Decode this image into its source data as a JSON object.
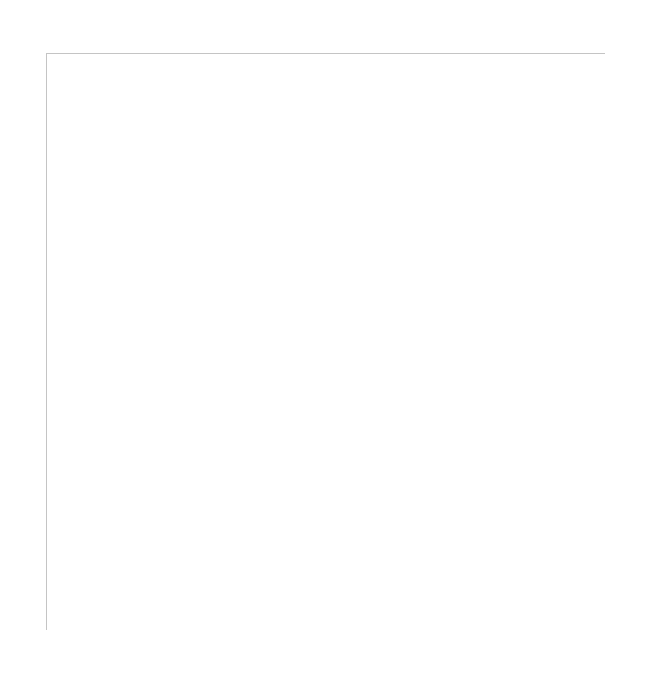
{
  "grid": {
    "columns": [
      "A",
      "B",
      "C",
      "D",
      "E",
      "F",
      "G",
      "H",
      "I",
      "J",
      "K",
      "L"
    ],
    "rows": [
      "1",
      "2",
      "3",
      "4",
      "5",
      "6",
      "7",
      "8",
      "9",
      "10",
      "11",
      "12"
    ],
    "line_color": "#c4c4c4"
  }
}
